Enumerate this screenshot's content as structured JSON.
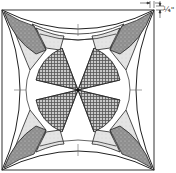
{
  "diagram": {
    "seam_allowance_label": "1/4\"",
    "seam_allowance_display": "¼\"",
    "colors": {
      "outline": "#222222",
      "light_fabric": "#e2e2e2",
      "medium_dots": "#9a9a9a",
      "plaid": "#8a8a8a",
      "white": "#ffffff"
    }
  }
}
